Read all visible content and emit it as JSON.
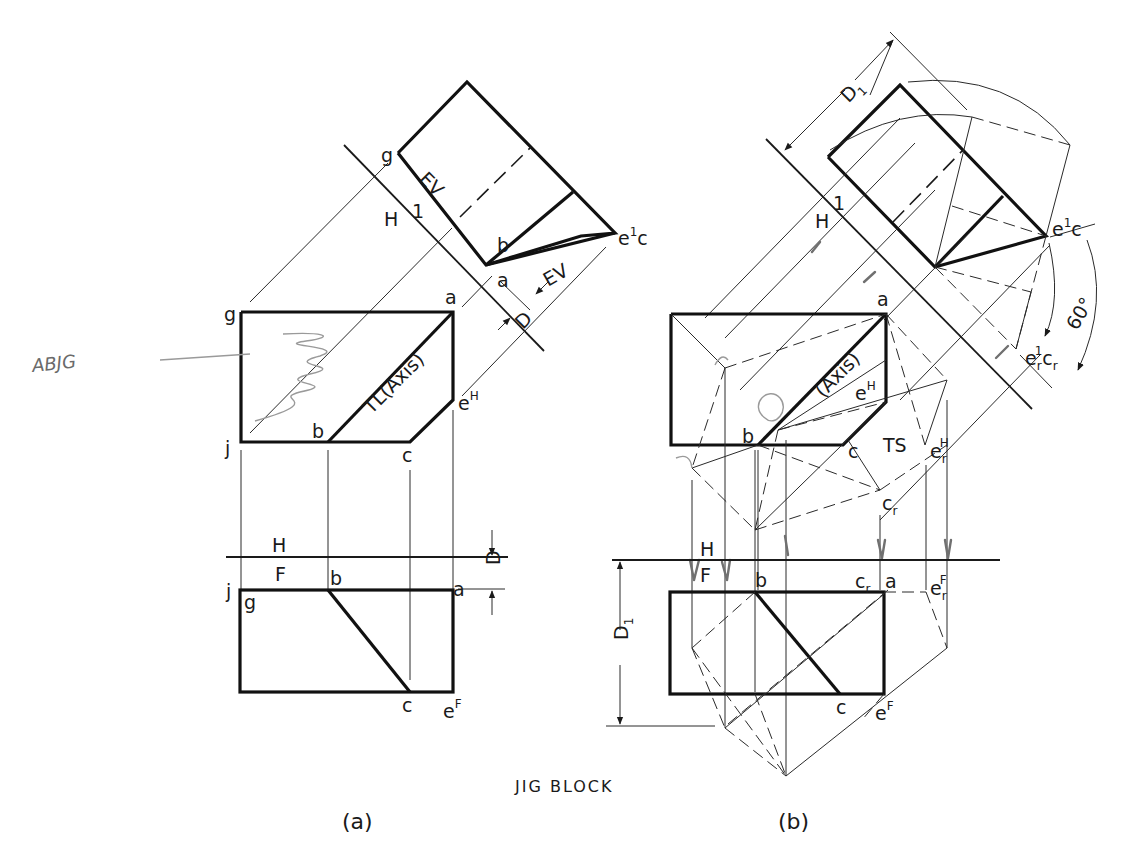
{
  "title": "JIG BLOCK",
  "subfigures": [
    {
      "id": "a",
      "caption": "(a)"
    },
    {
      "id": "b",
      "caption": "(b)"
    }
  ],
  "handwritten_note": "ABJG",
  "view_a": {
    "aux_view": {
      "points": {
        "g": "g",
        "b": "b",
        "a": "a",
        "ec": "e",
        "ec_sup": "1",
        "ec_tail": "c"
      },
      "annotations": {
        "ev_face": "EV",
        "ev_edge": "EV"
      },
      "fold_line": {
        "side_h": "H",
        "side_1": "1"
      },
      "dimension": "D"
    },
    "top_view": {
      "points": {
        "g": "g",
        "a": "a",
        "j": "j",
        "b": "b",
        "c": "c",
        "e": "e",
        "e_sup": "H"
      },
      "axis_label": "TL(Axis)"
    },
    "fold_line_hf": {
      "side_h": "H",
      "side_f": "F",
      "dimension": "D"
    },
    "front_view": {
      "points": {
        "j": "j",
        "g": "g",
        "b": "b",
        "a": "a",
        "c": "c",
        "e": "e",
        "e_sup": "F"
      }
    }
  },
  "view_b": {
    "aux_view": {
      "dimension": "D",
      "dimension_sub": "1",
      "fold_line": {
        "side_h": "H",
        "side_1": "1"
      },
      "points": {
        "ec": "e",
        "ec_sup": "1",
        "ec_tail": "c",
        "er": "e",
        "er_sub": "r",
        "er_sup": "1",
        "cr": "c",
        "cr_sub": "r"
      },
      "angle": "60°"
    },
    "top_view": {
      "points": {
        "a": "a",
        "b": "b",
        "c": "c",
        "e": "e",
        "e_sup": "H",
        "er": "e",
        "er_sub": "r",
        "er_sup": "H",
        "cr": "c",
        "cr_sub": "r"
      },
      "axis_label": "(Axis)",
      "ts_label": "TS"
    },
    "fold_line_hf": {
      "side_h": "H",
      "side_f": "F"
    },
    "front_view": {
      "dimension": "D",
      "dimension_sub": "1",
      "points": {
        "b": "b",
        "cr": "c",
        "cr_sub": "r",
        "a": "a",
        "er": "e",
        "er_sub": "r",
        "er_sup": "F",
        "c": "c",
        "e": "e",
        "e_sup": "F"
      }
    }
  }
}
